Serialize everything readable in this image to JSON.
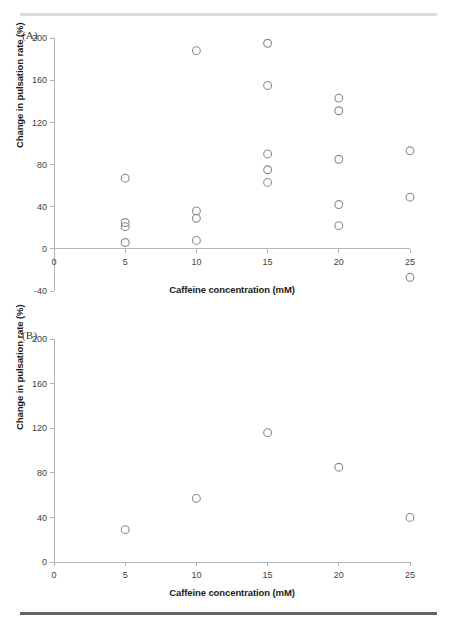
{
  "figure": {
    "top_rule_color": "#dcdcdc",
    "bottom_rule_color": "#636363",
    "marker_color": "#8a8a8a",
    "axis_color": "#b3b3b3",
    "text_color": "#1a1a1a"
  },
  "panels": [
    {
      "key": "A",
      "label": "(A)",
      "chart_data": {
        "type": "scatter",
        "title": "",
        "xlabel": "Caffeine concentration (mM)",
        "ylabel": "Change in pulsation rate (%)",
        "xlim": [
          0,
          25
        ],
        "ylim": [
          -40,
          200
        ],
        "xticks": [
          0,
          5,
          10,
          15,
          20,
          25
        ],
        "xticklabels": [
          "0",
          "5",
          "10",
          "15",
          "20",
          "25"
        ],
        "yticks": [
          -40,
          0,
          40,
          80,
          120,
          160,
          200
        ],
        "yticklabels": [
          "-40",
          "0",
          "40",
          "80",
          "120",
          "160",
          "200"
        ],
        "grid": false,
        "legend": null,
        "marker": "open-circle",
        "points": [
          {
            "x": 5,
            "y": 67
          },
          {
            "x": 5,
            "y": 25
          },
          {
            "x": 5,
            "y": 21
          },
          {
            "x": 5,
            "y": 6
          },
          {
            "x": 10,
            "y": 188
          },
          {
            "x": 10,
            "y": 36
          },
          {
            "x": 10,
            "y": 29
          },
          {
            "x": 10,
            "y": 8
          },
          {
            "x": 15,
            "y": 195
          },
          {
            "x": 15,
            "y": 155
          },
          {
            "x": 15,
            "y": 90
          },
          {
            "x": 15,
            "y": 75
          },
          {
            "x": 15,
            "y": 63
          },
          {
            "x": 20,
            "y": 143
          },
          {
            "x": 20,
            "y": 131
          },
          {
            "x": 20,
            "y": 85
          },
          {
            "x": 20,
            "y": 42
          },
          {
            "x": 20,
            "y": 22
          },
          {
            "x": 25,
            "y": 93
          },
          {
            "x": 25,
            "y": 49
          },
          {
            "x": 25,
            "y": -27
          }
        ]
      }
    },
    {
      "key": "B",
      "label": "(B)",
      "chart_data": {
        "type": "scatter",
        "title": "",
        "xlabel": "Caffeine concentration (mM)",
        "ylabel": "Change in pulsation rate (%)",
        "xlim": [
          0,
          25
        ],
        "ylim": [
          0,
          200
        ],
        "xticks": [
          0,
          5,
          10,
          15,
          20,
          25
        ],
        "xticklabels": [
          "0",
          "5",
          "10",
          "15",
          "20",
          "25"
        ],
        "yticks": [
          0,
          40,
          80,
          120,
          160,
          200
        ],
        "yticklabels": [
          "0",
          "40",
          "80",
          "120",
          "160",
          "200"
        ],
        "grid": false,
        "legend": null,
        "marker": "open-circle",
        "points": [
          {
            "x": 5,
            "y": 29
          },
          {
            "x": 10,
            "y": 57
          },
          {
            "x": 15,
            "y": 116
          },
          {
            "x": 20,
            "y": 85
          },
          {
            "x": 25,
            "y": 40
          }
        ]
      }
    }
  ]
}
